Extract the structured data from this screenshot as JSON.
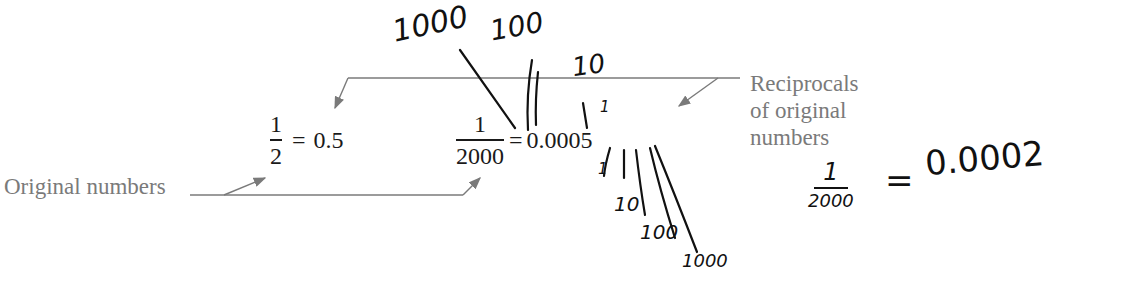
{
  "figure": {
    "labels": {
      "original": "Original numbers",
      "reciprocals": [
        "Reciprocals",
        "of original",
        "numbers"
      ]
    },
    "equations": [
      {
        "numerator": "1",
        "denominator": "2",
        "equals": "=",
        "result": "0.5"
      },
      {
        "numerator": "1",
        "denominator": "2000",
        "equals": "=",
        "result": "0.0005"
      }
    ],
    "colors": {
      "print_text": "#1a1a1a",
      "label_text": "#7a7a7a",
      "leader_lines": "#7a7a7a",
      "handwriting": "#111111"
    }
  },
  "handwriting": {
    "place_values_above": [
      "1000",
      "100",
      "10",
      "1"
    ],
    "place_values_below": [
      "1",
      "10",
      "100",
      "1000"
    ],
    "margin_note": {
      "numerator": "1",
      "denominator": "2000",
      "equals": "=",
      "result": "0.0002"
    }
  }
}
